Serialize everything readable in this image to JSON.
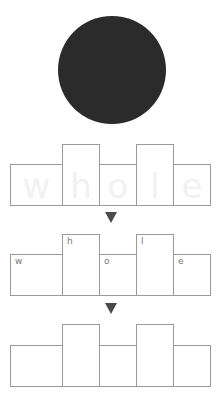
{
  "shape": {
    "type": "circle",
    "color": "#2b2b2b"
  },
  "word": "whole",
  "rows": [
    {
      "name": "ghost-letters",
      "letters": [
        "w",
        "h",
        "o",
        "l",
        "e"
      ],
      "style": "faint-letters-inside"
    },
    {
      "name": "labeled-letters",
      "letters": [
        "w",
        "h",
        "o",
        "l",
        "e"
      ],
      "style": "small-labels-top-left"
    },
    {
      "name": "empty-boxes",
      "letters": [
        "",
        "",
        "",
        "",
        ""
      ],
      "style": "empty"
    }
  ],
  "box_pattern": [
    "short",
    "tall",
    "short",
    "tall",
    "short"
  ],
  "arrow_glyph": "down-triangle"
}
